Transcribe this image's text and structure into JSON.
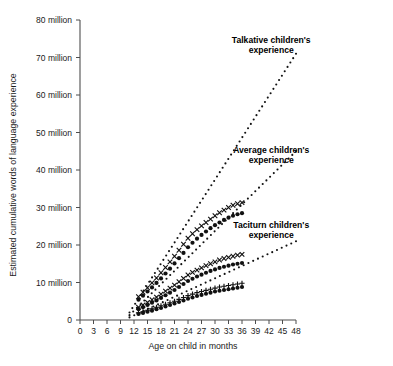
{
  "chart_data": {
    "type": "scatter",
    "title": "",
    "xlabel": "Age on child in months",
    "ylabel": "Estimated cumulative words of language experience",
    "xlim": [
      0,
      48
    ],
    "ylim": [
      0,
      80000000
    ],
    "grid": false,
    "legend_position": "inline-annotations",
    "xticks": [
      0,
      3,
      6,
      9,
      12,
      15,
      18,
      21,
      24,
      27,
      30,
      33,
      36,
      39,
      42,
      45,
      48
    ],
    "xtick_labels": [
      "0",
      "3",
      "6",
      "9",
      "12",
      "15",
      "18",
      "21",
      "24",
      "27",
      "30",
      "33",
      "36",
      "39",
      "42",
      "45",
      "48"
    ],
    "yticks": [
      0,
      10000000,
      20000000,
      30000000,
      40000000,
      50000000,
      60000000,
      70000000,
      80000000
    ],
    "ytick_labels": [
      "0",
      "10 million",
      "20 million",
      "30 million",
      "40 million",
      "50 million",
      "60 million",
      "70 million",
      "80 million"
    ],
    "annotations": [
      {
        "text_line1": "Talkative children's",
        "text_line2": "experience",
        "x": 42.5,
        "y": 74000000
      },
      {
        "text_line1": "Average children's",
        "text_line2": "experience",
        "x": 42.5,
        "y": 44500000
      },
      {
        "text_line1": "Taciturn children's",
        "text_line2": "experience",
        "x": 42.5,
        "y": 24500000
      }
    ],
    "series": [
      {
        "name": "Talkative band upper",
        "marker": "x",
        "group": "talkative",
        "x": [
          13,
          14,
          15,
          16,
          17,
          18,
          19,
          20,
          21,
          22,
          23,
          24,
          25,
          26,
          27,
          28,
          29,
          30,
          31,
          32,
          33,
          34,
          35,
          36
        ],
        "values": [
          6200000,
          7400000,
          8600000,
          9900000,
          11200000,
          12600000,
          14000000,
          15500000,
          17000000,
          18600000,
          20200000,
          21800000,
          23000000,
          24100000,
          25100000,
          26000000,
          26900000,
          27800000,
          28600000,
          29300000,
          30000000,
          30600000,
          31000000,
          31300000
        ]
      },
      {
        "name": "Talkative band lower",
        "marker": "circle",
        "group": "talkative",
        "x": [
          13,
          14,
          15,
          16,
          17,
          18,
          19,
          20,
          21,
          22,
          23,
          24,
          25,
          26,
          27,
          28,
          29,
          30,
          31,
          32,
          33,
          34,
          35,
          36
        ],
        "values": [
          5400000,
          6500000,
          7600000,
          8700000,
          9900000,
          11100000,
          12400000,
          13700000,
          15100000,
          16500000,
          17900000,
          19400000,
          20600000,
          21700000,
          22700000,
          23600000,
          24500000,
          25300000,
          26000000,
          26700000,
          27300000,
          27800000,
          28200000,
          28500000
        ]
      },
      {
        "name": "Average band upper",
        "marker": "x",
        "group": "average",
        "x": [
          13,
          14,
          15,
          16,
          17,
          18,
          19,
          20,
          21,
          22,
          23,
          24,
          25,
          26,
          27,
          28,
          29,
          30,
          31,
          32,
          33,
          34,
          35,
          36
        ],
        "values": [
          3400000,
          4000000,
          4700000,
          5400000,
          6100000,
          6900000,
          7700000,
          8500000,
          9300000,
          10200000,
          11100000,
          12000000,
          12700000,
          13300000,
          13900000,
          14500000,
          15000000,
          15500000,
          16000000,
          16400000,
          16700000,
          17000000,
          17300000,
          17500000
        ]
      },
      {
        "name": "Average band lower",
        "marker": "circle",
        "group": "average",
        "x": [
          13,
          14,
          15,
          16,
          17,
          18,
          19,
          20,
          21,
          22,
          23,
          24,
          25,
          26,
          27,
          28,
          29,
          30,
          31,
          32,
          33,
          34,
          35,
          36
        ],
        "values": [
          2900000,
          3400000,
          4000000,
          4600000,
          5200000,
          5900000,
          6600000,
          7300000,
          8000000,
          8800000,
          9600000,
          10400000,
          11000000,
          11600000,
          12100000,
          12600000,
          13100000,
          13500000,
          13900000,
          14200000,
          14500000,
          14800000,
          15000000,
          15200000
        ]
      },
      {
        "name": "Taciturn band upper",
        "marker": "plus",
        "group": "taciturn",
        "x": [
          13,
          14,
          15,
          16,
          17,
          18,
          19,
          20,
          21,
          22,
          23,
          24,
          25,
          26,
          27,
          28,
          29,
          30,
          31,
          32,
          33,
          34,
          35,
          36
        ],
        "values": [
          1900000,
          2200000,
          2600000,
          3000000,
          3400000,
          3800000,
          4200000,
          4600000,
          5000000,
          5500000,
          6000000,
          6500000,
          6900000,
          7300000,
          7600000,
          7900000,
          8200000,
          8500000,
          8800000,
          9000000,
          9200000,
          9400000,
          9600000,
          9800000
        ]
      },
      {
        "name": "Taciturn band lower",
        "marker": "circle",
        "group": "taciturn",
        "x": [
          13,
          14,
          15,
          16,
          17,
          18,
          19,
          20,
          21,
          22,
          23,
          24,
          25,
          26,
          27,
          28,
          29,
          30,
          31,
          32,
          33,
          34,
          35,
          36
        ],
        "values": [
          1600000,
          1900000,
          2200000,
          2500000,
          2900000,
          3200000,
          3600000,
          4000000,
          4400000,
          4800000,
          5200000,
          5700000,
          6000000,
          6400000,
          6700000,
          7000000,
          7300000,
          7600000,
          7800000,
          8000000,
          8200000,
          8400000,
          8600000,
          8800000
        ]
      }
    ],
    "extrapolations": [
      {
        "name": "Talkative extrapolation",
        "style": "dotted",
        "x_start": 11,
        "y_start": 2000000,
        "x_end": 48,
        "y_end": 71000000
      },
      {
        "name": "Average extrapolation",
        "style": "dotted",
        "x_start": 11,
        "y_start": 1300000,
        "x_end": 48,
        "y_end": 45000000
      },
      {
        "name": "Taciturn extrapolation",
        "style": "dotted",
        "x_start": 11,
        "y_start": 700000,
        "x_end": 48,
        "y_end": 21000000
      }
    ]
  }
}
